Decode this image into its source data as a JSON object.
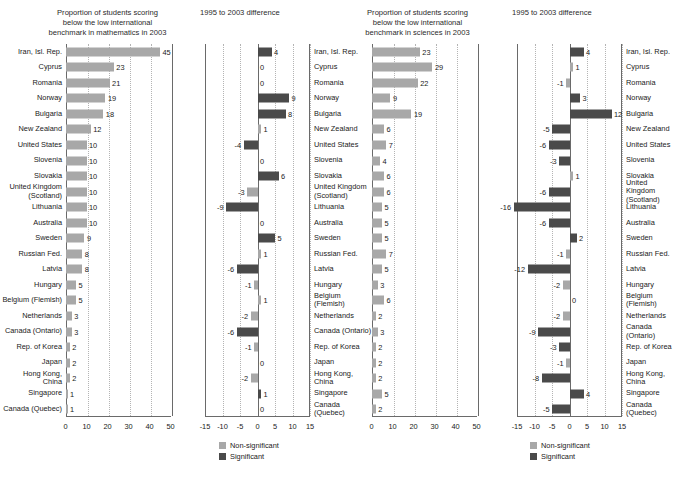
{
  "figure": {
    "categories": [
      "Iran, Isl. Rep.",
      "Cyprus",
      "Romania",
      "Norway",
      "Bulgaria",
      "New Zealand",
      "United States",
      "Slovenia",
      "Slovakia",
      "United Kingdom\n(Scotland)",
      "Lithuania",
      "Australia",
      "Sweden",
      "Russian Fed.",
      "Latvia",
      "Hungary",
      "Belgium (Flemish)",
      "Netherlands",
      "Canada (Ontario)",
      "Rep. of Korea",
      "Japan",
      "Hong Kong, China",
      "Singapore",
      "Canada (Quebec)"
    ],
    "legend": {
      "non_significant": "Non-significant",
      "significant": "Significant"
    },
    "colors": {
      "non_significant": "#a8a8a8",
      "significant": "#4a4a4a",
      "axis": "#6a6a6a",
      "grid": "#b4b4b4"
    },
    "source_note": ""
  },
  "chart_data": [
    {
      "type": "bar",
      "orientation": "horizontal",
      "title": "Proportion of students scoring\nbelow the low international\nbenchmark in mathematics in 2003",
      "xlabel": "",
      "ylabel": "",
      "xlim": [
        0,
        50
      ],
      "xticks": [
        0,
        10,
        20,
        30,
        40,
        50
      ],
      "grid": true,
      "legend_position": "none",
      "categories": [
        "Iran, Isl. Rep.",
        "Cyprus",
        "Romania",
        "Norway",
        "Bulgaria",
        "New Zealand",
        "United States",
        "Slovenia",
        "Slovakia",
        "United Kingdom (Scotland)",
        "Lithuania",
        "Australia",
        "Sweden",
        "Russian Fed.",
        "Latvia",
        "Hungary",
        "Belgium (Flemish)",
        "Netherlands",
        "Canada (Ontario)",
        "Rep. of Korea",
        "Japan",
        "Hong Kong, China",
        "Singapore",
        "Canada (Quebec)"
      ],
      "values": [
        45,
        23,
        21,
        19,
        18,
        12,
        10,
        10,
        10,
        10,
        10,
        10,
        9,
        8,
        8,
        5,
        5,
        3,
        3,
        2,
        2,
        2,
        1,
        1
      ],
      "significance": [
        "ns",
        "ns",
        "ns",
        "ns",
        "ns",
        "ns",
        "ns",
        "ns",
        "ns",
        "ns",
        "ns",
        "ns",
        "ns",
        "ns",
        "ns",
        "ns",
        "ns",
        "ns",
        "ns",
        "ns",
        "ns",
        "ns",
        "ns",
        "ns"
      ]
    },
    {
      "type": "bar",
      "orientation": "horizontal",
      "title": "1995 to 2003 difference",
      "xlabel": "",
      "ylabel": "",
      "xlim": [
        -15,
        15
      ],
      "xticks": [
        -15,
        -10,
        -5,
        0,
        5,
        10,
        15
      ],
      "grid": true,
      "legend_position": "below",
      "categories": [
        "Iran, Isl. Rep.",
        "Cyprus",
        "Romania",
        "Norway",
        "Bulgaria",
        "New Zealand",
        "United States",
        "Slovenia",
        "Slovakia",
        "United Kingdom (Scotland)",
        "Lithuania",
        "Australia",
        "Sweden",
        "Russian Fed.",
        "Latvia",
        "Hungary",
        "Belgium (Flemish)",
        "Netherlands",
        "Canada (Ontario)",
        "Rep. of Korea",
        "Japan",
        "Hong Kong, China",
        "Singapore",
        "Canada (Quebec)"
      ],
      "values": [
        4,
        0,
        0,
        9,
        8,
        1,
        -4,
        0,
        6,
        -3,
        -9,
        0,
        5,
        1,
        -6,
        -1,
        1,
        -2,
        -6,
        -1,
        0,
        -2,
        1,
        0
      ],
      "significance": [
        "sig",
        "ns",
        "ns",
        "sig",
        "sig",
        "ns",
        "sig",
        "ns",
        "sig",
        "ns",
        "sig",
        "ns",
        "sig",
        "ns",
        "sig",
        "ns",
        "ns",
        "ns",
        "sig",
        "ns",
        "ns",
        "ns",
        "sig",
        "ns"
      ]
    },
    {
      "type": "bar",
      "orientation": "horizontal",
      "title": "Proportion of students scoring\nbelow the low international\nbenchmark in sciences in 2003",
      "xlabel": "",
      "ylabel": "",
      "xlim": [
        0,
        50
      ],
      "xticks": [
        0,
        10,
        20,
        30,
        40,
        50
      ],
      "grid": true,
      "legend_position": "none",
      "categories": [
        "Iran, Isl. Rep.",
        "Cyprus",
        "Romania",
        "Norway",
        "Bulgaria",
        "New Zealand",
        "United States",
        "Slovenia",
        "Slovakia",
        "United Kingdom (Scotland)",
        "Lithuania",
        "Australia",
        "Sweden",
        "Russian Fed.",
        "Latvia",
        "Hungary",
        "Belgium (Flemish)",
        "Netherlands",
        "Canada (Ontario)",
        "Rep. of Korea",
        "Japan",
        "Hong Kong, China",
        "Singapore",
        "Canada (Quebec)"
      ],
      "values": [
        23,
        29,
        22,
        9,
        19,
        6,
        7,
        4,
        6,
        6,
        5,
        5,
        5,
        7,
        5,
        3,
        6,
        2,
        3,
        2,
        2,
        2,
        5,
        2
      ],
      "significance": [
        "ns",
        "ns",
        "ns",
        "ns",
        "ns",
        "ns",
        "ns",
        "ns",
        "ns",
        "ns",
        "ns",
        "ns",
        "ns",
        "ns",
        "ns",
        "ns",
        "ns",
        "ns",
        "ns",
        "ns",
        "ns",
        "ns",
        "ns",
        "ns"
      ]
    },
    {
      "type": "bar",
      "orientation": "horizontal",
      "title": "1995 to 2003 difference",
      "xlabel": "",
      "ylabel": "",
      "xlim": [
        -15,
        15
      ],
      "xticks": [
        -15,
        -10,
        -5,
        0,
        5,
        10,
        15
      ],
      "grid": true,
      "legend_position": "below",
      "categories": [
        "Iran, Isl. Rep.",
        "Cyprus",
        "Romania",
        "Norway",
        "Bulgaria",
        "New Zealand",
        "United States",
        "Slovenia",
        "Slovakia",
        "United Kingdom (Scotland)",
        "Lithuania",
        "Australia",
        "Sweden",
        "Russian Fed.",
        "Latvia",
        "Hungary",
        "Belgium (Flemish)",
        "Netherlands",
        "Canada (Ontario)",
        "Rep. of Korea",
        "Japan",
        "Hong Kong, China",
        "Singapore",
        "Canada (Quebec)"
      ],
      "values": [
        4,
        1,
        -1,
        3,
        12,
        -5,
        -6,
        -3,
        1,
        -6,
        -16,
        -6,
        2,
        -1,
        -12,
        -2,
        0,
        -2,
        -9,
        -3,
        -1,
        -8,
        4,
        -5
      ],
      "significance": [
        "sig",
        "ns",
        "ns",
        "sig",
        "sig",
        "sig",
        "sig",
        "sig",
        "ns",
        "sig",
        "sig",
        "sig",
        "sig",
        "ns",
        "sig",
        "ns",
        "ns",
        "ns",
        "sig",
        "sig",
        "ns",
        "sig",
        "sig",
        "sig"
      ]
    }
  ]
}
